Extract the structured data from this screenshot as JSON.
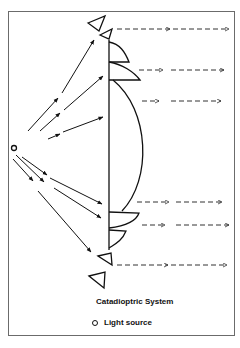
{
  "figure": {
    "title": "Catadioptric System",
    "legend": {
      "marker": "open-circle",
      "label": "Light source"
    },
    "colors": {
      "stroke": "#111111",
      "dash": "#333333",
      "frame": "#6b6b6b"
    }
  },
  "elements": {
    "light_source": {
      "x": 14,
      "y": 148,
      "r": 2.5
    },
    "lens_axis": {
      "x": 109,
      "y1": 42,
      "y2": 248
    },
    "central_lens": "Aspheric convex lens between y=80 and y=210",
    "prisms_top": [
      {
        "points": "88,23 105,16 99,31"
      },
      {
        "points": "100,35 112,29 109,39"
      }
    ],
    "prisms_bottom": [
      {
        "points": "98,256 111,253 112,265"
      },
      {
        "points": "89,276 105,272 104,288"
      }
    ],
    "rays_in": [
      [
        16,
        145,
        94,
        40
      ],
      [
        16,
        146,
        103,
        61
      ],
      [
        18,
        148,
        102,
        93
      ],
      [
        18,
        151,
        103,
        195
      ],
      [
        16,
        153,
        101,
        218
      ],
      [
        14,
        154,
        92,
        252
      ]
    ],
    "rays_out": [
      {
        "y": 29,
        "x1": 117,
        "x2": 229
      },
      {
        "y": 70,
        "x1": 139,
        "x2": 224
      },
      {
        "y": 101,
        "x1": 142,
        "x2": 221
      },
      {
        "y": 202,
        "x1": 137,
        "x2": 222
      },
      {
        "y": 225,
        "x1": 142,
        "x2": 229
      },
      {
        "y": 265,
        "x1": 117,
        "x2": 227
      }
    ]
  }
}
